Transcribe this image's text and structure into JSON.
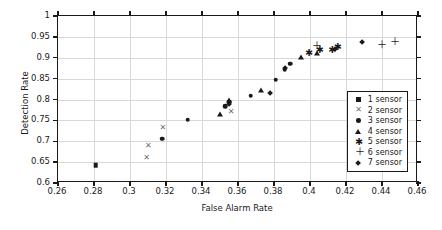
{
  "chart_data": {
    "type": "scatter",
    "title": "",
    "xlabel": "False Alarm Rate",
    "ylabel": "Detection Rate",
    "xlim": [
      0.26,
      0.46
    ],
    "ylim": [
      0.6,
      1
    ],
    "xticks": [
      "0.26",
      "0.28",
      "0.3",
      "0.32",
      "0.34",
      "0.36",
      "0.38",
      "0.4",
      "0.42",
      "0.44",
      "0.46"
    ],
    "xtick_values": [
      0.26,
      0.28,
      0.3,
      0.32,
      0.34,
      0.36,
      0.38,
      0.4,
      0.42,
      0.44,
      0.46
    ],
    "yticks": [
      "0.6",
      "0.65",
      "0.7",
      "0.75",
      "0.8",
      "0.85",
      "0.9",
      "0.95",
      "1"
    ],
    "ytick_values": [
      0.6,
      0.65,
      0.7,
      0.75,
      0.8,
      0.85,
      0.9,
      0.95,
      1
    ],
    "grid": true,
    "legend_position": "lower right",
    "series": [
      {
        "name": "1 sensor",
        "marker": "square",
        "color": "#1a1a1a",
        "points": [
          [
            0.281,
            0.643
          ]
        ]
      },
      {
        "name": "2 sensor",
        "marker": "x",
        "color": "#6f6f6f",
        "points": [
          [
            0.309,
            0.661
          ],
          [
            0.31,
            0.688
          ],
          [
            0.318,
            0.731
          ],
          [
            0.356,
            0.769
          ]
        ]
      },
      {
        "name": "3 sensor",
        "marker": "circle",
        "color": "#1a1a1a",
        "points": [
          [
            0.318,
            0.706
          ],
          [
            0.332,
            0.752
          ],
          [
            0.353,
            0.784
          ],
          [
            0.355,
            0.795
          ],
          [
            0.367,
            0.809
          ],
          [
            0.381,
            0.847
          ],
          [
            0.386,
            0.873
          ],
          [
            0.389,
            0.886
          ]
        ]
      },
      {
        "name": "4 sensor",
        "marker": "triangle",
        "color": "#1a1a1a",
        "points": [
          [
            0.35,
            0.765
          ],
          [
            0.355,
            0.798
          ],
          [
            0.373,
            0.822
          ],
          [
            0.395,
            0.901
          ],
          [
            0.404,
            0.912
          ]
        ]
      },
      {
        "name": "5 sensor",
        "marker": "asterisk",
        "color": "#1a1a1a",
        "points": [
          [
            0.399,
            0.911
          ],
          [
            0.405,
            0.918
          ],
          [
            0.412,
            0.918
          ],
          [
            0.415,
            0.925
          ]
        ]
      },
      {
        "name": "6 sensor",
        "marker": "plus",
        "color": "#1a1a1a",
        "points": [
          [
            0.403,
            0.927
          ],
          [
            0.439,
            0.931
          ],
          [
            0.446,
            0.937
          ]
        ]
      },
      {
        "name": "7 sensor",
        "marker": "diamond",
        "color": "#1a1a1a",
        "points": [
          [
            0.355,
            0.79
          ],
          [
            0.378,
            0.816
          ],
          [
            0.386,
            0.874
          ],
          [
            0.414,
            0.92
          ],
          [
            0.429,
            0.938
          ]
        ]
      }
    ]
  },
  "legend": {
    "entries": [
      {
        "label": "1 sensor",
        "marker": "square"
      },
      {
        "label": "2 sensor",
        "marker": "x"
      },
      {
        "label": "3 sensor",
        "marker": "circle"
      },
      {
        "label": "4 sensor",
        "marker": "triangle"
      },
      {
        "label": "5 sensor",
        "marker": "asterisk"
      },
      {
        "label": "6 sensor",
        "marker": "plus"
      },
      {
        "label": "7 sensor",
        "marker": "diamond"
      }
    ]
  }
}
